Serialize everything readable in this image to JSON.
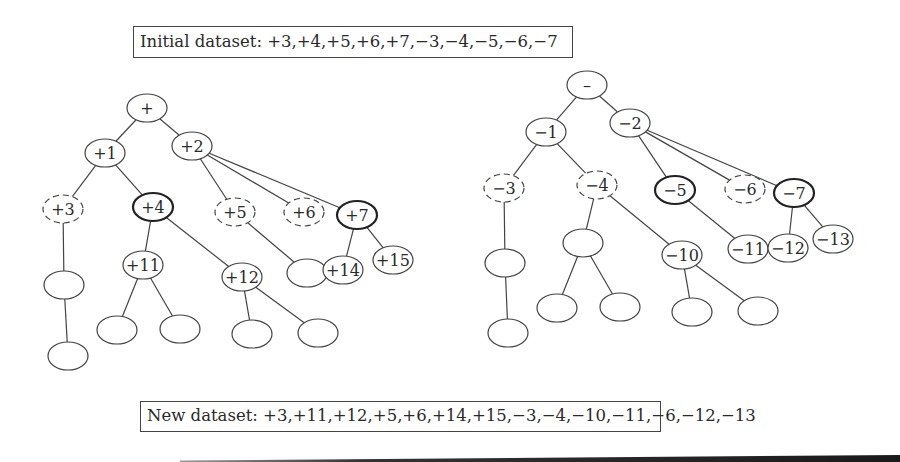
{
  "initial_dataset": {
    "label": "Initial dataset:",
    "values": "+3,+4,+5,+6,+7,−3,−4,−5,−6,−7",
    "text": "Initial dataset: +3,+4,+5,+6,+7,−3,−4,−5,−6,−7"
  },
  "new_dataset": {
    "label": "New dataset:",
    "values": "+3,+11,+12,+5,+6,+14,+15,−3,−4,−10,−11,−6,−12,−13",
    "text": "New dataset: +3,+11,+12,+5,+6,+14,+15,−3,−4,−10,−11,−6,−12,−13"
  },
  "node_size": {
    "rx": 20,
    "ry": 14
  },
  "trees": [
    {
      "name": "positive-tree",
      "nodes": [
        {
          "id": "p_root",
          "label": "+",
          "x": 147,
          "y": 108,
          "style": "normal"
        },
        {
          "id": "p1",
          "label": "+1",
          "x": 105,
          "y": 153,
          "style": "normal"
        },
        {
          "id": "p2",
          "label": "+2",
          "x": 192,
          "y": 146,
          "style": "normal"
        },
        {
          "id": "p3",
          "label": "+3",
          "x": 63,
          "y": 209,
          "style": "dashed"
        },
        {
          "id": "p4",
          "label": "+4",
          "x": 153,
          "y": 207,
          "style": "bold"
        },
        {
          "id": "p5",
          "label": "+5",
          "x": 235,
          "y": 212,
          "style": "dashed"
        },
        {
          "id": "p6",
          "label": "+6",
          "x": 304,
          "y": 212,
          "style": "dashed"
        },
        {
          "id": "p7",
          "label": "+7",
          "x": 357,
          "y": 215,
          "style": "bold"
        },
        {
          "id": "p3a",
          "label": "",
          "x": 64,
          "y": 285,
          "style": "normal"
        },
        {
          "id": "p3b",
          "label": "",
          "x": 68,
          "y": 356,
          "style": "normal"
        },
        {
          "id": "p11",
          "label": "+11",
          "x": 143,
          "y": 265,
          "style": "normal"
        },
        {
          "id": "p12",
          "label": "+12",
          "x": 242,
          "y": 277,
          "style": "normal"
        },
        {
          "id": "p11a",
          "label": "",
          "x": 117,
          "y": 330,
          "style": "normal"
        },
        {
          "id": "p11b",
          "label": "",
          "x": 180,
          "y": 329,
          "style": "normal"
        },
        {
          "id": "p12a",
          "label": "",
          "x": 252,
          "y": 334,
          "style": "normal"
        },
        {
          "id": "p12b",
          "label": "",
          "x": 318,
          "y": 333,
          "style": "normal"
        },
        {
          "id": "p5a",
          "label": "",
          "x": 307,
          "y": 273,
          "style": "normal"
        },
        {
          "id": "p14",
          "label": "+14",
          "x": 343,
          "y": 270,
          "style": "normal"
        },
        {
          "id": "p15",
          "label": "+15",
          "x": 393,
          "y": 260,
          "style": "normal"
        }
      ],
      "edges": [
        [
          "p_root",
          "p1"
        ],
        [
          "p_root",
          "p2"
        ],
        [
          "p1",
          "p3"
        ],
        [
          "p1",
          "p4"
        ],
        [
          "p2",
          "p5"
        ],
        [
          "p2",
          "p6"
        ],
        [
          "p2",
          "p7"
        ],
        [
          "p3",
          "p3a"
        ],
        [
          "p3a",
          "p3b"
        ],
        [
          "p4",
          "p11"
        ],
        [
          "p4",
          "p12"
        ],
        [
          "p11",
          "p11a"
        ],
        [
          "p11",
          "p11b"
        ],
        [
          "p12",
          "p12a"
        ],
        [
          "p12",
          "p12b"
        ],
        [
          "p5",
          "p5a"
        ],
        [
          "p7",
          "p14"
        ],
        [
          "p7",
          "p15"
        ]
      ]
    },
    {
      "name": "negative-tree",
      "nodes": [
        {
          "id": "n_root",
          "label": "–",
          "x": 587,
          "y": 85,
          "style": "normal"
        },
        {
          "id": "n1",
          "label": "−1",
          "x": 546,
          "y": 132,
          "style": "normal"
        },
        {
          "id": "n2",
          "label": "−2",
          "x": 630,
          "y": 123,
          "style": "normal"
        },
        {
          "id": "n3",
          "label": "−3",
          "x": 504,
          "y": 188,
          "style": "dashed"
        },
        {
          "id": "n4",
          "label": "−4",
          "x": 597,
          "y": 185,
          "style": "dashed"
        },
        {
          "id": "n5",
          "label": "−5",
          "x": 675,
          "y": 190,
          "style": "bold"
        },
        {
          "id": "n6",
          "label": "−6",
          "x": 745,
          "y": 189,
          "style": "dashed"
        },
        {
          "id": "n7",
          "label": "−7",
          "x": 794,
          "y": 193,
          "style": "bold"
        },
        {
          "id": "n3a",
          "label": "",
          "x": 505,
          "y": 263,
          "style": "normal"
        },
        {
          "id": "n3b",
          "label": "",
          "x": 508,
          "y": 333,
          "style": "normal"
        },
        {
          "id": "n4a",
          "label": "",
          "x": 583,
          "y": 243,
          "style": "normal"
        },
        {
          "id": "n4aa",
          "label": "",
          "x": 557,
          "y": 308,
          "style": "normal"
        },
        {
          "id": "n4ab",
          "label": "",
          "x": 620,
          "y": 307,
          "style": "normal"
        },
        {
          "id": "n10",
          "label": "−10",
          "x": 682,
          "y": 255,
          "style": "normal"
        },
        {
          "id": "n10a",
          "label": "",
          "x": 692,
          "y": 312,
          "style": "normal"
        },
        {
          "id": "n10b",
          "label": "",
          "x": 758,
          "y": 311,
          "style": "normal"
        },
        {
          "id": "n11",
          "label": "−11",
          "x": 748,
          "y": 249,
          "style": "normal"
        },
        {
          "id": "n12",
          "label": "−12",
          "x": 788,
          "y": 248,
          "style": "normal"
        },
        {
          "id": "n13",
          "label": "−13",
          "x": 833,
          "y": 239,
          "style": "normal"
        }
      ],
      "edges": [
        [
          "n_root",
          "n1"
        ],
        [
          "n_root",
          "n2"
        ],
        [
          "n1",
          "n3"
        ],
        [
          "n1",
          "n4"
        ],
        [
          "n2",
          "n5"
        ],
        [
          "n2",
          "n6"
        ],
        [
          "n2",
          "n7"
        ],
        [
          "n3",
          "n3a"
        ],
        [
          "n3a",
          "n3b"
        ],
        [
          "n4",
          "n4a"
        ],
        [
          "n4",
          "n10"
        ],
        [
          "n4a",
          "n4aa"
        ],
        [
          "n4a",
          "n4ab"
        ],
        [
          "n10",
          "n10a"
        ],
        [
          "n10",
          "n10b"
        ],
        [
          "n5",
          "n11"
        ],
        [
          "n7",
          "n12"
        ],
        [
          "n7",
          "n13"
        ]
      ]
    }
  ]
}
